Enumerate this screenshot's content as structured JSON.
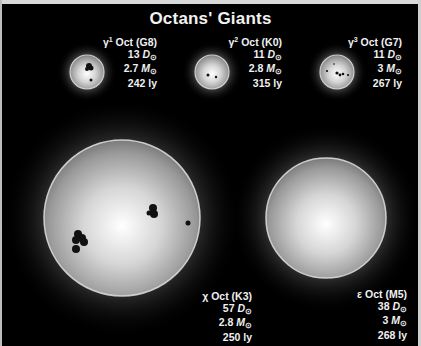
{
  "title": "Octans' Giants",
  "stars": [
    {
      "id": "gamma1",
      "greek": "γ",
      "superscript": "1",
      "name": "Oct",
      "spectral": "(G8)",
      "diameter": "13",
      "diameter_unit": "D",
      "mass": "2.7",
      "mass_unit": "M",
      "distance": "242 ly"
    },
    {
      "id": "gamma2",
      "greek": "γ",
      "superscript": "2",
      "name": "Oct",
      "spectral": "(K0)",
      "diameter": "11",
      "diameter_unit": "D",
      "mass": "2.8",
      "mass_unit": "M",
      "distance": "315 ly"
    },
    {
      "id": "gamma3",
      "greek": "γ",
      "superscript": "3",
      "name": "Oct",
      "spectral": "(G7)",
      "diameter": "11",
      "diameter_unit": "D",
      "mass": "3",
      "mass_unit": "M",
      "distance": "267 ly"
    },
    {
      "id": "chi",
      "greek": "χ",
      "superscript": "",
      "name": "Oct",
      "spectral": "(K3)",
      "diameter": "57",
      "diameter_unit": "D",
      "mass": "2.8",
      "mass_unit": "M",
      "distance": "250 ly"
    },
    {
      "id": "epsilon",
      "greek": "ε",
      "superscript": "",
      "name": "Oct",
      "spectral": "(M5)",
      "diameter": "38",
      "diameter_unit": "D",
      "mass": "3",
      "mass_unit": "M",
      "distance": "268 ly"
    }
  ],
  "sun_symbol": "⊙",
  "colors": {
    "background": "#000000",
    "star_core": "#ffffff",
    "star_limb": "#8a8a8a",
    "ring": "#d9d9d9",
    "spot": "#111111",
    "text": "#f0f0f0"
  }
}
